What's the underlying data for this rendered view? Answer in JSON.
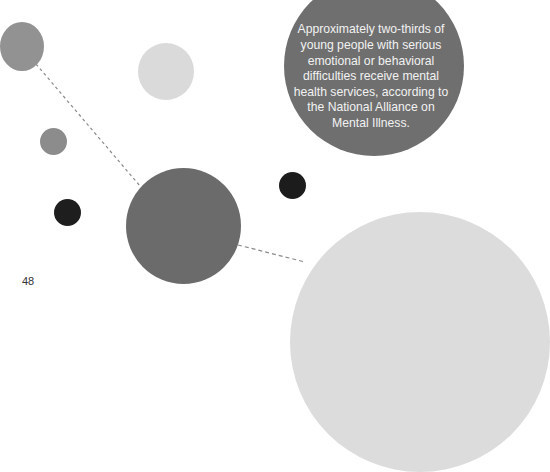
{
  "quote": {
    "text": "Approximately two-thirds of young people with serious emotional or behavioral difficulties receive mental health services, according to the National Alliance on Mental Illness."
  },
  "page_number": "48",
  "colors": {
    "background": "#ffffff",
    "quote_circle": "#6f6f6f",
    "dark_circle": "#1e1e1e",
    "mid_gray": "#8e8e8e",
    "light_gray": "#dadada",
    "large_center": "#6b6b6b"
  }
}
